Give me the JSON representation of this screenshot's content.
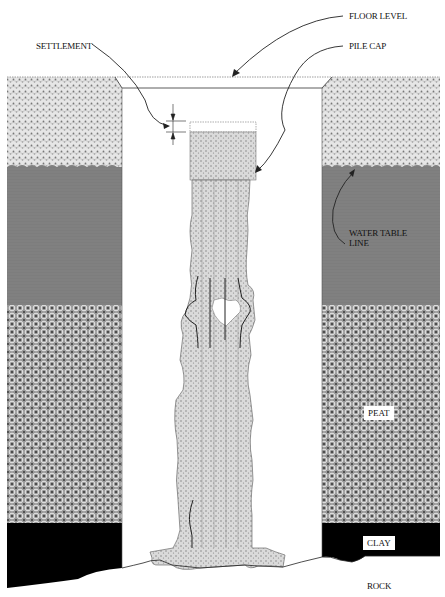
{
  "diagram": {
    "labels": {
      "floor_level": "FLOOR LEVEL",
      "settlement": "SETTLEMENT",
      "pile_cap": "PILE CAP",
      "water_table_line": "WATER TABLE\nLINE",
      "water_table_line_1": "WATER TABLE",
      "water_table_line_2": "LINE",
      "peat": "PEAT",
      "clay": "CLAY",
      "rock": "ROCK"
    },
    "layers": [
      {
        "name": "fill",
        "top": 77,
        "bottom": 167,
        "pattern": "light stipple",
        "color": "#d8d8d8"
      },
      {
        "name": "water-saturated",
        "top": 167,
        "bottom": 305,
        "pattern": "grey",
        "color": "#7a7a7a"
      },
      {
        "name": "peat",
        "top": 305,
        "bottom": 523,
        "pattern": "circle weave",
        "color": "#8c8c8c"
      },
      {
        "name": "clay",
        "top": 523,
        "bottom": 575,
        "pattern": "solid",
        "color": "#000000"
      },
      {
        "name": "rock",
        "top": 560,
        "bottom": 597,
        "pattern": "none",
        "color": "#ffffff"
      }
    ],
    "colors": {
      "line": "#111111",
      "pile_fill": "#d0d0d0",
      "water": "#7a7a7a",
      "peat": "#8c8c8c",
      "clay": "#000000"
    }
  }
}
